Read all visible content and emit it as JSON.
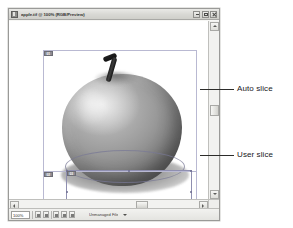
{
  "window": {
    "title": "apple.tif @ 100% (RGB/Preview)",
    "icon": "photoshop-document-icon",
    "controls": {
      "minimize_label": "Minimize",
      "maximize_label": "Maximize",
      "close_label": "Close"
    }
  },
  "canvas": {
    "image_name": "apple-photo",
    "auto_slice_label": "auto-slice-region",
    "user_slice_label": "user-slice-region",
    "badges": [
      {
        "id": "badge-01",
        "text": "01"
      },
      {
        "id": "badge-02",
        "text": "02"
      },
      {
        "id": "badge-03",
        "text": "03"
      }
    ]
  },
  "status_bar": {
    "zoom_value": "100%",
    "doc_info": "Unmanaged File",
    "menu_arrow": "triangle-down-icon"
  },
  "scrollbars": {
    "vertical_up": "scroll-up-arrow",
    "vertical_down": "scroll-down-arrow",
    "horizontal_left": "scroll-left-arrow",
    "horizontal_right": "scroll-right-arrow"
  },
  "annotations": [
    {
      "id": "auto",
      "label": "Auto slice"
    },
    {
      "id": "user",
      "label": "User slice"
    }
  ],
  "colors": {
    "page_background": "#ffffff",
    "window_chrome": "#f2f2f0",
    "title_bar": "#d8d8d4",
    "slice_line": "#b9b9d2",
    "user_slice_line": "#8f8fb0",
    "badge_fill": "#8c8c93",
    "callout_line": "#2c2c2a",
    "callout_text": "#17171a"
  }
}
